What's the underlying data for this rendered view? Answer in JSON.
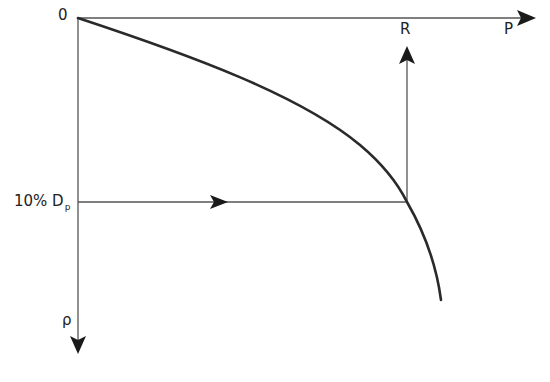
{
  "diagram": {
    "labels": {
      "origin": "0",
      "x_axis": "P",
      "y_axis": "ρ",
      "r_marker": "R",
      "level_main": "10% D",
      "level_sub": "p"
    },
    "colors": {
      "axis": "#555555",
      "curve": "#2a2a2a",
      "arrow": "#1a1a1a",
      "text": "#222222"
    }
  }
}
